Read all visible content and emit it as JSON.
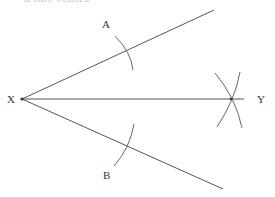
{
  "caption": "a line centre",
  "diagram": {
    "points": {
      "X": {
        "label": "X",
        "x": 22,
        "y": 99
      },
      "Y": {
        "label": "Y",
        "x": 231,
        "y": 99
      },
      "A": {
        "label": "A",
        "x": 127,
        "y": 51
      },
      "B": {
        "label": "B",
        "x": 126,
        "y": 146
      }
    },
    "labels": {
      "X": "X",
      "Y": "Y",
      "A": "A",
      "B": "B"
    },
    "colors": {
      "line": "#555555",
      "arc": "#666666",
      "text": "#333333",
      "background": "#ffffff"
    }
  }
}
